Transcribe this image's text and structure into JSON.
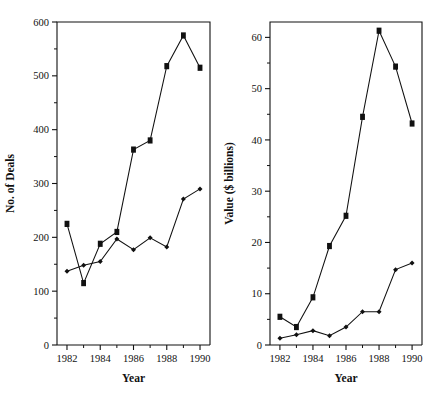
{
  "figure": {
    "title": "",
    "panel_count": 2
  },
  "chart_data": [
    {
      "id": "deals",
      "type": "line",
      "title": "",
      "xlabel": "Year",
      "ylabel": "No. of Deals",
      "x": [
        1982,
        1983,
        1984,
        1985,
        1986,
        1987,
        1988,
        1989,
        1990
      ],
      "xlim": [
        1981.4,
        1990.6
      ],
      "ylim": [
        0,
        600
      ],
      "xticks": [
        1982,
        1984,
        1986,
        1988,
        1990
      ],
      "xticklabels": [
        "1982",
        "1984",
        "1986",
        "1988",
        "1990"
      ],
      "xminorticks": [
        1983,
        1985,
        1987,
        1989
      ],
      "yticks": [
        0,
        100,
        200,
        300,
        400,
        500,
        600
      ],
      "yticklabels": [
        "0",
        "100",
        "200",
        "300",
        "400",
        "500",
        "600"
      ],
      "yminorticks": [
        50,
        150,
        250,
        350,
        450,
        550
      ],
      "grid": false,
      "legend": "none",
      "series": [
        {
          "name": "Squares",
          "marker": "square",
          "values": [
            225,
            115,
            188,
            210,
            363,
            380,
            518,
            575,
            515
          ]
        },
        {
          "name": "Diamonds",
          "marker": "diamond",
          "values": [
            137,
            148,
            155,
            197,
            177,
            199,
            182,
            271,
            290
          ]
        }
      ]
    },
    {
      "id": "value",
      "type": "line",
      "title": "",
      "xlabel": "Year",
      "ylabel": "Value ($ billions)",
      "x": [
        1982,
        1983,
        1984,
        1985,
        1986,
        1987,
        1988,
        1989,
        1990
      ],
      "xlim": [
        1981.4,
        1990.6
      ],
      "ylim": [
        0,
        63
      ],
      "xticks": [
        1982,
        1984,
        1986,
        1988,
        1990
      ],
      "xticklabels": [
        "1982",
        "1984",
        "1986",
        "1988",
        "1990"
      ],
      "xminorticks": [
        1983,
        1985,
        1987,
        1989
      ],
      "yticks": [
        0,
        10,
        20,
        30,
        40,
        50,
        60
      ],
      "yticklabels": [
        "0",
        "10",
        "20",
        "30",
        "40",
        "50",
        "60"
      ],
      "yminorticks": [
        5,
        15,
        25,
        35,
        45,
        55
      ],
      "grid": false,
      "legend": "none",
      "series": [
        {
          "name": "Squares",
          "marker": "square",
          "values": [
            5.5,
            3.5,
            9.3,
            19.3,
            25.2,
            44.5,
            61.3,
            54.3,
            43.2
          ]
        },
        {
          "name": "Diamonds",
          "marker": "diamond",
          "values": [
            1.3,
            2.0,
            2.8,
            1.8,
            3.5,
            6.5,
            6.5,
            14.7,
            16.0
          ]
        }
      ]
    }
  ],
  "colors": {
    "ink": "#111111",
    "background": "#ffffff"
  }
}
